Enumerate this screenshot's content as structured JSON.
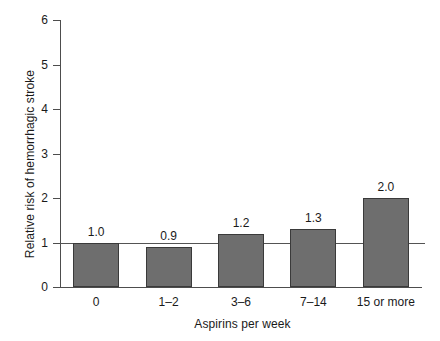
{
  "chart_data": {
    "type": "bar",
    "title": "",
    "xlabel": "Aspirins per week",
    "ylabel": "Relative risk of hemorrhagic stroke",
    "categories": [
      "0",
      "1–2",
      "3–6",
      "7–14",
      "15 or more"
    ],
    "values": [
      1.0,
      0.9,
      1.2,
      1.3,
      2.0
    ],
    "value_labels": [
      "1.0",
      "0.9",
      "1.2",
      "1.3",
      "2.0"
    ],
    "ylim": [
      0,
      6
    ],
    "yticks": [
      0,
      1,
      2,
      3,
      4,
      5,
      6
    ],
    "ytick_labels": [
      "0",
      "1",
      "2",
      "3",
      "4",
      "5",
      "6"
    ],
    "grid": false,
    "legend": "none",
    "reference_line": {
      "value": 1,
      "label": ""
    },
    "colors": {
      "bar_fill": "#6e6e6e",
      "bar_edge": "#3a3a3a",
      "axis": "#4d4d4d",
      "reference_line": "#545454",
      "background": "#ffffff",
      "text": "#1a1a1a"
    }
  }
}
